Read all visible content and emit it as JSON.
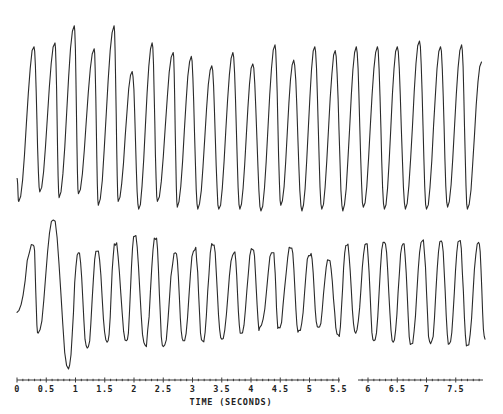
{
  "chart_data": {
    "type": "line",
    "title": "",
    "xlabel": "TIME (SECONDS)",
    "ylabel": "",
    "xlim": [
      0,
      8
    ],
    "grid": false,
    "legend": null,
    "x_ticks": [
      0,
      0.5,
      1,
      1.5,
      2,
      2.5,
      3,
      3.5,
      4,
      4.5,
      5,
      5.5,
      6,
      6.5,
      7,
      7.5
    ],
    "x_tick_labels": [
      "0",
      "0.5",
      "1",
      "1.5",
      "2",
      "2.5",
      "3",
      "3.5",
      "4",
      "4.5",
      "5",
      "5.5",
      "6",
      "6.5",
      "7",
      "7.5"
    ],
    "series": [
      {
        "name": "top-trace",
        "description": "Regular high-amplitude oscillation, 23 cycles over ~8 s (~2.9 Hz)",
        "peaks_time_s": [
          0.29,
          0.65,
          0.98,
          1.32,
          1.66,
          1.97,
          2.31,
          2.67,
          2.98,
          3.33,
          3.69,
          4.03,
          4.41,
          4.73,
          5.09,
          5.44,
          5.8,
          6.16,
          6.5,
          6.88,
          7.24,
          7.6,
          7.94
        ],
        "peaks_rel_amplitude": [
          0.86,
          0.88,
          0.97,
          0.85,
          0.97,
          0.73,
          0.88,
          0.83,
          0.81,
          0.76,
          0.83,
          0.77,
          0.87,
          0.79,
          0.86,
          0.84,
          0.86,
          0.86,
          0.86,
          0.89,
          0.86,
          0.87,
          0.78
        ],
        "troughs_time_s": [
          0.03,
          0.39,
          0.72,
          1.05,
          1.39,
          1.73,
          2.08,
          2.4,
          2.74,
          3.09,
          3.45,
          3.81,
          4.17,
          4.51,
          4.87,
          5.21,
          5.57,
          5.92,
          6.28,
          6.64,
          7.0,
          7.36,
          7.7
        ],
        "troughs_rel_amplitude": [
          0.05,
          0.1,
          0.07,
          0.09,
          0.03,
          0.05,
          0.01,
          0.05,
          0.02,
          0.01,
          0.01,
          0.01,
          0.0,
          0.03,
          0.0,
          0.01,
          0.0,
          0.02,
          0.01,
          0.01,
          0.01,
          0.02,
          0.01
        ]
      },
      {
        "name": "bottom-trace",
        "description": "Irregular multi-component oscillation with secondary shoulders, ~24 cycles over ~8 s; large transient near 0.6-0.9 s",
        "peaks_time_s": [
          0.28,
          0.62,
          1.05,
          1.37,
          1.68,
          2.01,
          2.37,
          2.71,
          3.04,
          3.35,
          3.71,
          4.03,
          4.38,
          4.68,
          5.01,
          5.33,
          5.64,
          5.97,
          6.28,
          6.6,
          6.93,
          7.25,
          7.56,
          7.89
        ],
        "peaks_rel_amplitude": [
          0.83,
          1.0,
          0.78,
          0.79,
          0.83,
          0.89,
          0.87,
          0.78,
          0.8,
          0.83,
          0.78,
          0.8,
          0.78,
          0.81,
          0.76,
          0.73,
          0.83,
          0.84,
          0.85,
          0.84,
          0.86,
          0.86,
          0.86,
          0.85
        ],
        "troughs_time_s": [
          0.36,
          0.88,
          1.2,
          1.54,
          1.87,
          2.19,
          2.5,
          2.84,
          3.17,
          3.5,
          3.83,
          4.15,
          4.47,
          4.82,
          5.15,
          5.49,
          5.79,
          6.1,
          6.43,
          6.74,
          7.07,
          7.39,
          7.7,
          8.0
        ],
        "troughs_rel_amplitude": [
          0.24,
          0.0,
          0.14,
          0.18,
          0.19,
          0.16,
          0.15,
          0.19,
          0.19,
          0.2,
          0.24,
          0.28,
          0.28,
          0.26,
          0.28,
          0.23,
          0.24,
          0.19,
          0.18,
          0.17,
          0.17,
          0.17,
          0.16,
          0.2
        ]
      }
    ]
  }
}
